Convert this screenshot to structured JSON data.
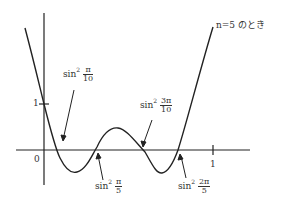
{
  "figure": {
    "curve_label": "n=5 のとき",
    "origin_label": "0",
    "x_tick_label": "1",
    "y_tick_label": "1",
    "roots": [
      {
        "func": "sin",
        "power": "2",
        "num": "π",
        "den": "10"
      },
      {
        "func": "sin",
        "power": "2",
        "num": "π",
        "den": "5"
      },
      {
        "func": "sin",
        "power": "2",
        "num": "3π",
        "den": "10"
      },
      {
        "func": "sin",
        "power": "2",
        "num": "2π",
        "den": "5"
      }
    ]
  },
  "colors": {
    "stroke": "#222222",
    "background": "#ffffff"
  }
}
